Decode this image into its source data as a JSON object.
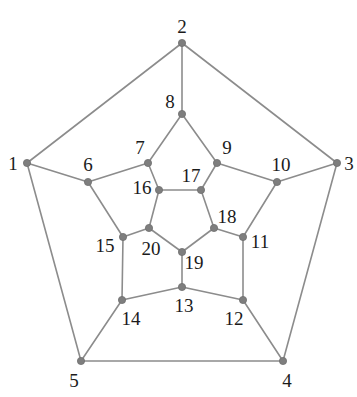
{
  "figure": {
    "background_color": "#ffffff",
    "edge_color": "#8c8c8c",
    "vertex_color": "#7e7e7e",
    "label_color": "#1b1b1b",
    "vertex_radius": 3.6,
    "width": 357,
    "height": 397
  },
  "chart_data": {
    "type": "diagram",
    "graph_kind": "planar-graph",
    "vertex_count": 20,
    "edge_count": 30,
    "vertices": [
      {
        "id": 1,
        "label": "1",
        "x": 27,
        "y": 163,
        "label_x": 13,
        "label_y": 163
      },
      {
        "id": 2,
        "label": "2",
        "x": 182,
        "y": 43,
        "label_x": 182,
        "label_y": 26
      },
      {
        "id": 3,
        "label": "3",
        "x": 337,
        "y": 163,
        "label_x": 349,
        "label_y": 163
      },
      {
        "id": 4,
        "label": "4",
        "x": 283,
        "y": 361,
        "label_x": 287,
        "label_y": 380
      },
      {
        "id": 5,
        "label": "5",
        "x": 81,
        "y": 361,
        "label_x": 74,
        "label_y": 380
      },
      {
        "id": 6,
        "label": "6",
        "x": 88,
        "y": 182,
        "label_x": 88,
        "label_y": 164
      },
      {
        "id": 7,
        "label": "7",
        "x": 148,
        "y": 163,
        "label_x": 140,
        "label_y": 147
      },
      {
        "id": 8,
        "label": "8",
        "x": 182,
        "y": 114,
        "label_x": 170,
        "label_y": 101
      },
      {
        "id": 9,
        "label": "9",
        "x": 217,
        "y": 163,
        "label_x": 227,
        "label_y": 147
      },
      {
        "id": 10,
        "label": "10",
        "x": 277,
        "y": 182,
        "label_x": 281,
        "label_y": 164
      },
      {
        "id": 11,
        "label": "11",
        "x": 243,
        "y": 237,
        "label_x": 260,
        "label_y": 241
      },
      {
        "id": 12,
        "label": "12",
        "x": 243,
        "y": 300,
        "label_x": 234,
        "label_y": 318
      },
      {
        "id": 13,
        "label": "13",
        "x": 182,
        "y": 287,
        "label_x": 184,
        "label_y": 305
      },
      {
        "id": 14,
        "label": "14",
        "x": 122,
        "y": 300,
        "label_x": 131,
        "label_y": 318
      },
      {
        "id": 15,
        "label": "15",
        "x": 123,
        "y": 237,
        "label_x": 105,
        "label_y": 245
      },
      {
        "id": 16,
        "label": "16",
        "x": 159,
        "y": 190,
        "label_x": 142,
        "label_y": 187
      },
      {
        "id": 17,
        "label": "17",
        "x": 201,
        "y": 190,
        "label_x": 191,
        "label_y": 175
      },
      {
        "id": 18,
        "label": "18",
        "x": 214,
        "y": 228,
        "label_x": 227,
        "label_y": 216
      },
      {
        "id": 19,
        "label": "19",
        "x": 182,
        "y": 252,
        "label_x": 194,
        "label_y": 262
      },
      {
        "id": 20,
        "label": "20",
        "x": 149,
        "y": 228,
        "label_x": 151,
        "label_y": 248
      }
    ],
    "edges": [
      [
        1,
        2
      ],
      [
        2,
        3
      ],
      [
        3,
        4
      ],
      [
        4,
        5
      ],
      [
        5,
        1
      ],
      [
        1,
        6
      ],
      [
        2,
        8
      ],
      [
        3,
        10
      ],
      [
        4,
        12
      ],
      [
        5,
        14
      ],
      [
        6,
        7
      ],
      [
        7,
        8
      ],
      [
        8,
        9
      ],
      [
        9,
        10
      ],
      [
        10,
        11
      ],
      [
        11,
        12
      ],
      [
        12,
        13
      ],
      [
        13,
        14
      ],
      [
        14,
        15
      ],
      [
        15,
        6
      ],
      [
        7,
        16
      ],
      [
        9,
        17
      ],
      [
        11,
        18
      ],
      [
        13,
        19
      ],
      [
        15,
        20
      ],
      [
        16,
        17
      ],
      [
        17,
        18
      ],
      [
        18,
        19
      ],
      [
        19,
        20
      ],
      [
        20,
        16
      ]
    ]
  }
}
